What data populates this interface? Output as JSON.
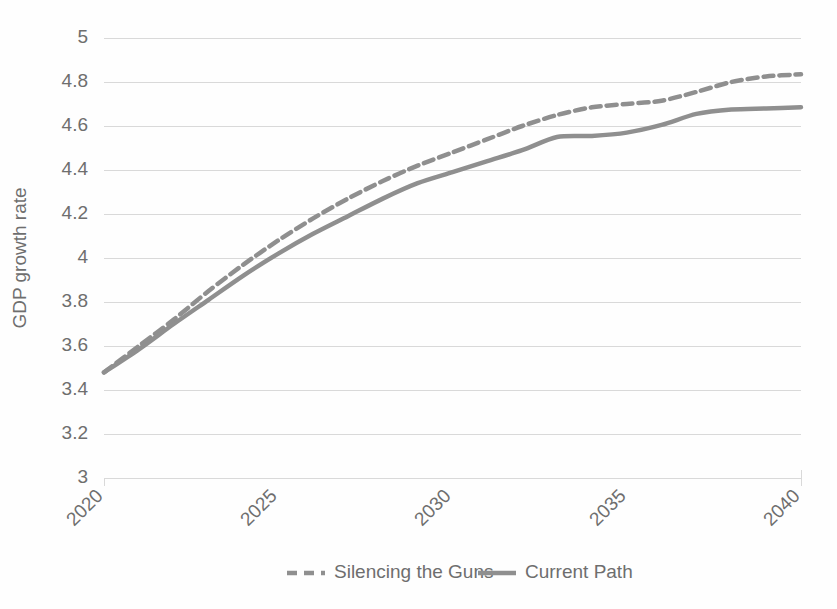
{
  "chart_data": {
    "type": "line",
    "title": "",
    "subtitle": "",
    "xlabel": "",
    "ylabel": "GDP growth rate",
    "xlim": [
      2020,
      2040
    ],
    "ylim": [
      3,
      5
    ],
    "grid": true,
    "grid_axis": "y",
    "legend_position": "bottom",
    "x": [
      2020,
      2021,
      2022,
      2023,
      2024,
      2025,
      2026,
      2027,
      2028,
      2029,
      2030,
      2031,
      2032,
      2033,
      2034,
      2035,
      2036,
      2037,
      2038,
      2039,
      2040
    ],
    "xticks": [
      2020,
      2025,
      2030,
      2035,
      2040
    ],
    "xtick_labels": [
      "2020",
      "2025",
      "2030",
      "2035",
      "2040"
    ],
    "yticks": [
      3,
      3.2,
      3.4,
      3.6,
      3.8,
      4,
      4.2,
      4.4,
      4.6,
      4.8,
      5
    ],
    "ytick_labels": [
      "3",
      "3.2",
      "3.4",
      "3.6",
      "3.8",
      "4",
      "4.2",
      "4.4",
      "4.6",
      "4.8",
      "5"
    ],
    "series": [
      {
        "name": "Silencing the Guns",
        "style": "dashed",
        "color": "#8f8f8f",
        "values": [
          3.48,
          3.6,
          3.72,
          3.85,
          3.97,
          4.08,
          4.18,
          4.27,
          4.35,
          4.42,
          4.48,
          4.54,
          4.6,
          4.65,
          4.685,
          4.7,
          4.715,
          4.755,
          4.8,
          4.825,
          4.835
        ]
      },
      {
        "name": "Current Path",
        "style": "solid",
        "color": "#8f8f8f",
        "values": [
          3.48,
          3.585,
          3.7,
          3.81,
          3.92,
          4.02,
          4.11,
          4.19,
          4.27,
          4.34,
          4.39,
          4.44,
          4.49,
          4.55,
          4.555,
          4.57,
          4.605,
          4.655,
          4.675,
          4.68,
          4.685
        ]
      }
    ]
  },
  "legend": {
    "items": [
      {
        "label": "Silencing the Guns",
        "style": "dashed",
        "color": "#8f8f8f"
      },
      {
        "label": "Current Path",
        "style": "solid",
        "color": "#8f8f8f"
      }
    ]
  },
  "colors": {
    "line": "#8f8f8f",
    "grid": "#d9d9d9",
    "text": "#6e6e6e",
    "background": "#fefefe"
  }
}
